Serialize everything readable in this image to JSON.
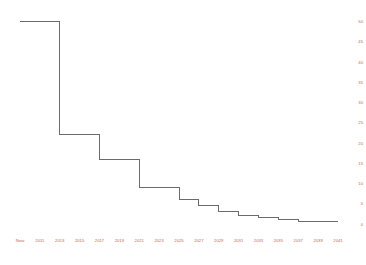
{
  "chart_data": {
    "type": "line",
    "title": "",
    "subtitle": "",
    "xlabel": "",
    "ylabel": "",
    "step": "post",
    "grid": false,
    "legend": null,
    "line_color": "#6b6b6b",
    "tick_color": "#c06a52",
    "background": "#ffffff",
    "ylim": [
      0,
      50
    ],
    "yticks": [
      0,
      5,
      10,
      15,
      20,
      25,
      30,
      35,
      40,
      45,
      50
    ],
    "ytick_labels": [
      "0",
      "5",
      "10",
      "15",
      "20",
      "25",
      "30",
      "35",
      "40",
      "45",
      "50"
    ],
    "ytick_position": "right",
    "xtick_labels": [
      "Now",
      "2011",
      "2013",
      "2015",
      "2017",
      "2019",
      "2021",
      "2023",
      "2025",
      "2027",
      "2029",
      "2031",
      "2033",
      "2035",
      "2037",
      "2039",
      "2041"
    ],
    "x": [
      "Now",
      "2011",
      "2013",
      "2015",
      "2017",
      "2019",
      "2021",
      "2023",
      "2025",
      "2027",
      "2029",
      "2031",
      "2033",
      "2035",
      "2037",
      "2039",
      "2041"
    ],
    "values": [
      50,
      50,
      22,
      22,
      16,
      16,
      9,
      9,
      6,
      4.5,
      3,
      2,
      1.5,
      1,
      0.7,
      0.5,
      0.5
    ],
    "series": [
      {
        "name": "value",
        "values": [
          50,
          50,
          22,
          22,
          16,
          16,
          9,
          9,
          6,
          4.5,
          3,
          2,
          1.5,
          1,
          0.7,
          0.5,
          0.5
        ]
      }
    ]
  }
}
